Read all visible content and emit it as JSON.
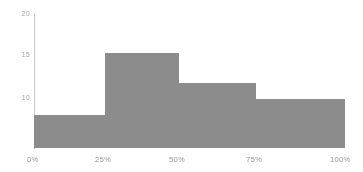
{
  "chart_data": {
    "type": "bar",
    "title": "",
    "subtitle": "",
    "xlabel": "",
    "ylabel": "",
    "categories": [
      "0%-25%",
      "25%-50%",
      "50%-75%",
      "75%-100%"
    ],
    "values": [
      7.9,
      15.3,
      11.6,
      9.8
    ],
    "bin_edges": [
      0,
      25,
      50,
      75,
      100
    ],
    "x_tick_labels": [
      "0%",
      "25%",
      "50%",
      "75%",
      "100%"
    ],
    "x_tick_values": [
      0,
      25,
      50,
      75,
      100
    ],
    "y_tick_labels": [
      "20",
      "15",
      "10"
    ],
    "y_tick_values": [
      20,
      15,
      10
    ],
    "xlim": [
      0,
      100
    ],
    "ylim": [
      6.2,
      20.4
    ],
    "grid": false,
    "legend": false,
    "legend_position": "none",
    "bar_color": "#8c8c8c",
    "axis_color": "#c9c9c9",
    "tick_label_color": "#a0a0a0",
    "background_color": "#ffffff"
  },
  "axis": {
    "y_labels": [
      {
        "text": "20",
        "top": 10
      },
      {
        "text": "15",
        "top": 51
      },
      {
        "text": "10",
        "top": 94
      }
    ],
    "x_labels": [
      {
        "text": "0%",
        "left": 27
      },
      {
        "text": "25%",
        "left": 95
      },
      {
        "text": "50%",
        "left": 169
      },
      {
        "text": "75%",
        "left": 246
      },
      {
        "text": "100%",
        "left": 330
      }
    ]
  },
  "bars": [
    {
      "name": "bin-0-25",
      "left": 34,
      "width": 71,
      "top": 115,
      "height": 33
    },
    {
      "name": "bin-25-50",
      "left": 105,
      "width": 74,
      "top": 53,
      "height": 95
    },
    {
      "name": "bin-50-75",
      "left": 179,
      "width": 77,
      "top": 83,
      "height": 65
    },
    {
      "name": "bin-75-100",
      "left": 256,
      "width": 89,
      "top": 99,
      "height": 49
    }
  ]
}
